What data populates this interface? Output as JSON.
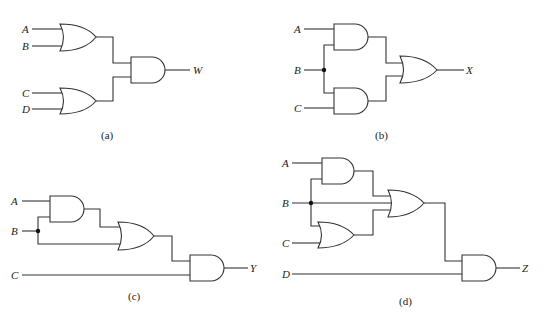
{
  "figure": {
    "panels": [
      {
        "id": "a",
        "caption": "(a)",
        "inputs": [
          "A",
          "B",
          "C",
          "D"
        ],
        "output": "W",
        "gates": [
          {
            "type": "OR",
            "inputs": [
              "A",
              "B"
            ]
          },
          {
            "type": "OR",
            "inputs": [
              "C",
              "D"
            ]
          },
          {
            "type": "AND",
            "inputs": [
              "OR1",
              "OR2"
            ],
            "output": "W"
          }
        ]
      },
      {
        "id": "b",
        "caption": "(b)",
        "inputs": [
          "A",
          "B",
          "C"
        ],
        "output": "X",
        "gates": [
          {
            "type": "AND",
            "inputs": [
              "A",
              "B"
            ]
          },
          {
            "type": "AND",
            "inputs": [
              "B",
              "C"
            ]
          },
          {
            "type": "OR",
            "inputs": [
              "AND1",
              "AND2"
            ],
            "output": "X"
          }
        ]
      },
      {
        "id": "c",
        "caption": "(c)",
        "inputs": [
          "A",
          "B",
          "C"
        ],
        "output": "Y",
        "gates": [
          {
            "type": "AND",
            "inputs": [
              "A",
              "B"
            ]
          },
          {
            "type": "OR",
            "inputs": [
              "AND1",
              "B"
            ]
          },
          {
            "type": "AND",
            "inputs": [
              "OR1",
              "C"
            ],
            "output": "Y"
          }
        ]
      },
      {
        "id": "d",
        "caption": "(d)",
        "inputs": [
          "A",
          "B",
          "C",
          "D"
        ],
        "output": "Z",
        "gates": [
          {
            "type": "AND",
            "inputs": [
              "A",
              "B"
            ]
          },
          {
            "type": "OR",
            "inputs": [
              "B",
              "C"
            ]
          },
          {
            "type": "OR",
            "inputs": [
              "AND1",
              "B",
              "OR2"
            ]
          },
          {
            "type": "AND",
            "inputs": [
              "OR1",
              "D"
            ],
            "output": "Z"
          }
        ]
      }
    ]
  },
  "labels": {
    "a": {
      "A": "A",
      "B": "B",
      "C": "C",
      "D": "D",
      "out": "W",
      "cap": "(a)"
    },
    "b": {
      "A": "A",
      "B": "B",
      "C": "C",
      "out": "X",
      "cap": "(b)"
    },
    "c": {
      "A": "A",
      "B": "B",
      "C": "C",
      "out": "Y",
      "cap": "(c)"
    },
    "d": {
      "A": "A",
      "B": "B",
      "C": "C",
      "D": "D",
      "out": "Z",
      "cap": "(d)"
    }
  }
}
